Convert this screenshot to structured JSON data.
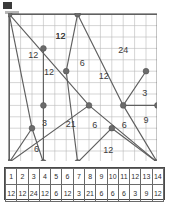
{
  "diagram": {
    "type": "graph-on-grid",
    "grid": {
      "cols": 13,
      "rows": 13,
      "cell_px": 11.4,
      "grid_color": "#b9b9b9",
      "border_color": "#5a5a5a"
    },
    "vertex_color": "#6b6b6b",
    "edge_color": "#5f5f5f",
    "vertices": [
      {
        "id": "A",
        "gx": 0,
        "gy": 0
      },
      {
        "id": "B",
        "gx": 6,
        "gy": 0
      },
      {
        "id": "C",
        "gx": 3,
        "gy": 3
      },
      {
        "id": "D",
        "gx": 5,
        "gy": 5
      },
      {
        "id": "E",
        "gx": 12,
        "gy": 5
      },
      {
        "id": "F",
        "gx": 3,
        "gy": 8
      },
      {
        "id": "G",
        "gx": 7,
        "gy": 8
      },
      {
        "id": "H",
        "gx": 10,
        "gy": 8
      },
      {
        "id": "I",
        "gx": 13,
        "gy": 8
      },
      {
        "id": "J",
        "gx": 2,
        "gy": 10
      },
      {
        "id": "K",
        "gx": 9,
        "gy": 10
      },
      {
        "id": "L",
        "gx": 0,
        "gy": 13
      },
      {
        "id": "M",
        "gx": 3,
        "gy": 13
      },
      {
        "id": "N",
        "gx": 6,
        "gy": 13
      },
      {
        "id": "O",
        "gx": 13,
        "gy": 13
      }
    ],
    "edges": [
      {
        "from": "A",
        "to": "G"
      },
      {
        "from": "A",
        "to": "J"
      },
      {
        "from": "B",
        "to": "D"
      },
      {
        "from": "B",
        "to": "H"
      },
      {
        "from": "C",
        "to": "M"
      },
      {
        "from": "D",
        "to": "N"
      },
      {
        "from": "E",
        "to": "H"
      },
      {
        "from": "H",
        "to": "I"
      },
      {
        "from": "H",
        "to": "O"
      },
      {
        "from": "K",
        "to": "N"
      },
      {
        "from": "K",
        "to": "O"
      },
      {
        "from": "J",
        "to": "L"
      },
      {
        "from": "J",
        "to": "M"
      },
      {
        "from": "L",
        "to": "G"
      },
      {
        "from": "G",
        "to": "O"
      }
    ],
    "edge_labels": [
      {
        "text": "12",
        "gx": 2.1,
        "gy": 3.6
      },
      {
        "text": "12",
        "gx": 4.5,
        "gy": 2.0
      },
      {
        "text": "12",
        "gx": 3.5,
        "gy": 5.1
      },
      {
        "text": "6",
        "gx": 6.4,
        "gy": 4.3
      },
      {
        "text": "24",
        "gx": 10.0,
        "gy": 3.2
      },
      {
        "text": "12",
        "gx": 8.3,
        "gy": 5.5
      },
      {
        "text": "12",
        "gx": 4.5,
        "gy": 2.0
      },
      {
        "text": "3",
        "gx": 11.9,
        "gy": 7.0
      },
      {
        "text": "9",
        "gx": 12.0,
        "gy": 9.3
      },
      {
        "text": "3",
        "gx": 3.1,
        "gy": 9.6
      },
      {
        "text": "21",
        "gx": 5.4,
        "gy": 9.7
      },
      {
        "text": "6",
        "gx": 7.5,
        "gy": 9.8
      },
      {
        "text": "6",
        "gx": 10.1,
        "gy": 9.8
      },
      {
        "text": "6",
        "gx": 2.4,
        "gy": 11.9
      },
      {
        "text": "12",
        "gx": 8.7,
        "gy": 12.0
      }
    ]
  },
  "table": {
    "columns": 14,
    "header": [
      "1",
      "2",
      "3",
      "4",
      "5",
      "6",
      "7",
      "8",
      "9",
      "10",
      "11",
      "12",
      "13",
      "14"
    ],
    "values": [
      "12",
      "12",
      "24",
      "12",
      "6",
      "12",
      "3",
      "21",
      "6",
      "6",
      "6",
      "3",
      "9",
      "12"
    ]
  }
}
